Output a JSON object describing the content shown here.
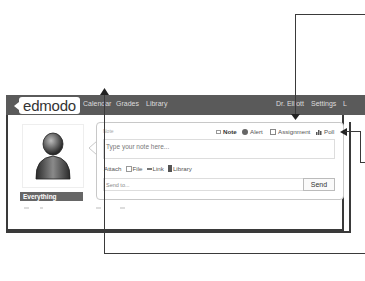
{
  "navbar": {
    "logo": "edmodo",
    "links": [
      "Calendar",
      "Grades",
      "Library"
    ],
    "right_links": [
      "Dr. Elliott",
      "Settings",
      "L"
    ]
  },
  "sidebar": {
    "filter_label": "Everything"
  },
  "post_box": {
    "small_label": "Note",
    "tabs": [
      {
        "label": "Note",
        "icon": "note-icon",
        "active": true
      },
      {
        "label": "Alert",
        "icon": "alert-icon",
        "active": false
      },
      {
        "label": "Assignment",
        "icon": "assignment-icon",
        "active": false
      },
      {
        "label": "Poll",
        "icon": "poll-icon",
        "active": false
      }
    ],
    "note_placeholder": "Type your note here...",
    "attach_label": "Attach",
    "attach_items": [
      {
        "label": "File",
        "icon": "file-icon"
      },
      {
        "label": "Link",
        "icon": "link-icon"
      },
      {
        "label": "Library",
        "icon": "library-icon"
      }
    ],
    "sendto_placeholder": "Send to...",
    "send_button": "Send"
  },
  "colors": {
    "navbar_bg": "#5a5a5a",
    "callout_line": "#3a3a3a",
    "everything_bg": "#666666"
  }
}
